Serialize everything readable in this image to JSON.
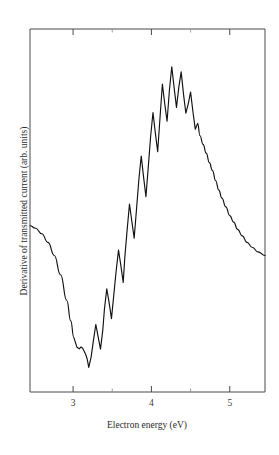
{
  "chart_data": {
    "type": "line",
    "title": "",
    "xlabel": "Electron energy (eV)",
    "ylabel": "Derivative of transmitted current (arb. units)",
    "xlim": [
      2.45,
      5.45
    ],
    "ylim": [
      0,
      100
    ],
    "grid": false,
    "legend": null,
    "xticks": [
      3,
      4,
      5
    ],
    "xtick_labels": [
      "3",
      "4",
      "5"
    ],
    "xminor_ticks": [
      3.5,
      4.5
    ],
    "yticks": [],
    "ytick_labels": [],
    "series": [
      {
        "name": "derivative-of-transmitted-current",
        "x": [
          2.45,
          2.52,
          2.6,
          2.68,
          2.76,
          2.84,
          2.92,
          2.97,
          3.01,
          3.05,
          3.08,
          3.1,
          3.12,
          3.14,
          3.16,
          3.18,
          3.2,
          3.23,
          3.26,
          3.29,
          3.32,
          3.35,
          3.38,
          3.4,
          3.43,
          3.46,
          3.49,
          3.52,
          3.55,
          3.58,
          3.61,
          3.64,
          3.66,
          3.69,
          3.72,
          3.75,
          3.78,
          3.81,
          3.84,
          3.87,
          3.9,
          3.93,
          3.96,
          3.99,
          4.02,
          4.05,
          4.08,
          4.11,
          4.14,
          4.17,
          4.2,
          4.23,
          4.26,
          4.29,
          4.32,
          4.35,
          4.38,
          4.41,
          4.44,
          4.47,
          4.5,
          4.53,
          4.56,
          4.59,
          4.62,
          4.66,
          4.7,
          4.74,
          4.78,
          4.82,
          4.86,
          4.9,
          4.95,
          5.0,
          5.05,
          5.1,
          5.16,
          5.22,
          5.29,
          5.36,
          5.45
        ],
        "y": [
          45.8,
          45.1,
          43.6,
          41.2,
          37.6,
          32.3,
          25.2,
          19.6,
          15.0,
          12.3,
          11.9,
          12.4,
          12.1,
          11.3,
          10.4,
          9.1,
          6.8,
          9.6,
          14.2,
          18.6,
          15.2,
          11.8,
          17.2,
          22.8,
          28.4,
          24.6,
          20.2,
          26.8,
          33.4,
          39.1,
          34.8,
          30.2,
          37.0,
          44.6,
          51.8,
          47.0,
          42.4,
          50.4,
          58.6,
          65.0,
          59.2,
          53.8,
          62.0,
          70.4,
          77.0,
          71.4,
          66.2,
          75.6,
          84.8,
          79.4,
          74.6,
          83.2,
          89.6,
          83.8,
          78.4,
          84.0,
          88.2,
          82.0,
          76.8,
          79.4,
          82.6,
          77.2,
          72.4,
          74.0,
          70.6,
          68.2,
          65.8,
          63.2,
          61.0,
          58.2,
          55.6,
          53.4,
          51.0,
          48.6,
          46.8,
          44.8,
          43.0,
          41.2,
          39.8,
          38.6,
          37.6
        ],
        "color": "#111111",
        "linewidth": 1.15,
        "marker": "none"
      }
    ]
  },
  "axes": {
    "frame": {
      "left_px": 30,
      "right_px": 265,
      "top_px": 29,
      "bottom_px": 392
    },
    "frame_color": "#4a4a4a",
    "tick_color": "#4a4a4a"
  },
  "figure": {
    "background_color": "#ffffff",
    "curve_color": "#111111",
    "edge_mark_color": "#9a9a9a"
  }
}
